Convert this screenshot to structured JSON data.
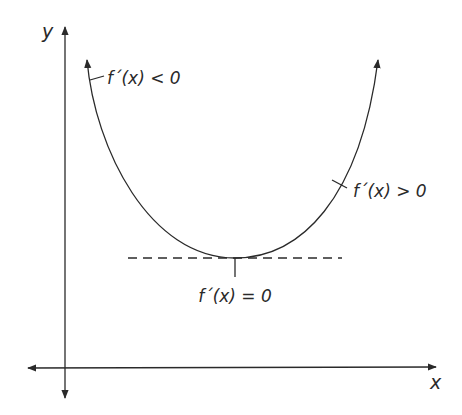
{
  "diagram": {
    "title": "",
    "axes": {
      "x_label": "x",
      "y_label": "y"
    },
    "curve": {
      "shape": "parabola-upward",
      "labels": {
        "decreasing": "f´(x) < 0",
        "increasing": "f´(x) > 0",
        "minimum": "f´(x) = 0"
      }
    },
    "tangent_line": {
      "style": "dashed",
      "meaning": "horizontal tangent at minimum"
    },
    "colors": {
      "stroke": "#2a2a2a",
      "background": "#ffffff"
    }
  }
}
